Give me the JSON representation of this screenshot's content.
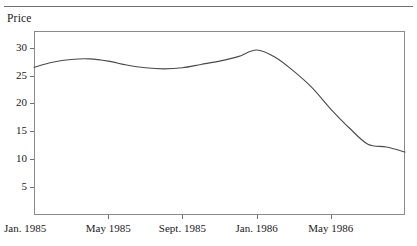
{
  "figure": {
    "axis_title": "Price",
    "line_color": "#4a4a4a",
    "frame_color": "#8a8a8a"
  },
  "chart_data": {
    "type": "line",
    "title": "",
    "subtitle": "",
    "xlabel": "",
    "ylabel": "Price",
    "grid": false,
    "legend": "none",
    "ylim": [
      0,
      33
    ],
    "yticks": [
      5,
      10,
      15,
      20,
      25,
      30
    ],
    "ytick_labels": [
      "5",
      "10",
      "15",
      "20",
      "25",
      "30"
    ],
    "xtick_labels": [
      "Jan. 1985",
      "May 1985",
      "Sept. 1985",
      "Jan. 1986",
      "May 1986"
    ],
    "xtick_positions": [
      0,
      4,
      8,
      12,
      16
    ],
    "xlim": [
      0,
      20
    ],
    "x": [
      0,
      1,
      2,
      3,
      4,
      5,
      6,
      7,
      8,
      9,
      10,
      11,
      12,
      13,
      14,
      15,
      16,
      17,
      18,
      19,
      20
    ],
    "series": [
      {
        "name": "Price",
        "values": [
          26.5,
          27.4,
          27.9,
          28.0,
          27.6,
          26.9,
          26.4,
          26.2,
          26.4,
          27.0,
          27.6,
          28.4,
          29.6,
          28.3,
          25.8,
          22.8,
          19.0,
          15.6,
          12.7,
          12.2,
          11.3
        ]
      }
    ],
    "annotations": []
  }
}
